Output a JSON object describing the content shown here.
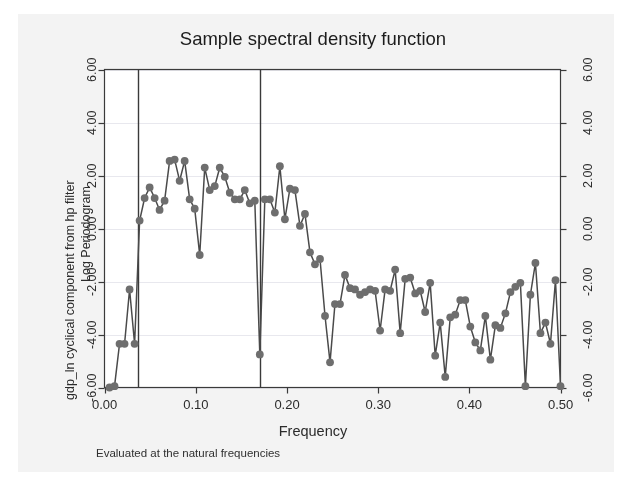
{
  "chart_data": {
    "type": "line",
    "title": "Sample spectral density function",
    "xlabel": "Frequency",
    "ylabel_outer": "gdp_ln cyclical component from hp filter",
    "ylabel_inner": "Log Periodogram",
    "footnote": "Evaluated at the natural frequencies",
    "xlim": [
      0.0,
      0.5
    ],
    "ylim": [
      -6.0,
      6.0
    ],
    "xticks": [
      0.0,
      0.1,
      0.2,
      0.3,
      0.4,
      0.5
    ],
    "xtick_labels": [
      "0.00",
      "0.10",
      "0.20",
      "0.30",
      "0.40",
      "0.50"
    ],
    "yticks": [
      -6.0,
      -4.0,
      -2.0,
      0.0,
      2.0,
      4.0,
      6.0
    ],
    "ytick_labels": [
      "-6.00",
      "-4.00",
      "-2.00",
      "0.00",
      "2.00",
      "4.00",
      "6.00"
    ],
    "ytick_labels_right": [
      "-6.00",
      "-4.00",
      "-2.00",
      "0.00",
      "2.00",
      "4.00",
      "6.00"
    ],
    "grid": true,
    "grid_axis": "y",
    "legend": "none",
    "marker": "circle",
    "marker_color": "#6e6e6e",
    "line_color": "#4a4a4a",
    "vlines": [
      0.0367,
      0.1702
    ],
    "vline_color": "#3a3a3a",
    "series": [
      {
        "name": "Log Periodogram",
        "x": [
          0.0055,
          0.011,
          0.0165,
          0.022,
          0.0275,
          0.033,
          0.0385,
          0.044,
          0.0495,
          0.055,
          0.0604,
          0.0659,
          0.0714,
          0.0769,
          0.0824,
          0.0879,
          0.0934,
          0.0989,
          0.1044,
          0.1099,
          0.1154,
          0.1209,
          0.1264,
          0.1319,
          0.1374,
          0.1429,
          0.1484,
          0.1538,
          0.1593,
          0.1648,
          0.1703,
          0.1758,
          0.1813,
          0.1868,
          0.1923,
          0.1978,
          0.2033,
          0.2088,
          0.2143,
          0.2198,
          0.2253,
          0.2308,
          0.2363,
          0.2418,
          0.2473,
          0.2527,
          0.2582,
          0.2637,
          0.2692,
          0.2747,
          0.2802,
          0.2857,
          0.2912,
          0.2967,
          0.3022,
          0.3077,
          0.3132,
          0.3187,
          0.3242,
          0.3297,
          0.3352,
          0.3407,
          0.3462,
          0.3516,
          0.3571,
          0.3626,
          0.3681,
          0.3736,
          0.3791,
          0.3846,
          0.3901,
          0.3956,
          0.4011,
          0.4066,
          0.4121,
          0.4176,
          0.4231,
          0.4286,
          0.4341,
          0.4396,
          0.4451,
          0.4505,
          0.456,
          0.4615,
          0.467,
          0.4725,
          0.478,
          0.4835,
          0.489,
          0.4945,
          0.5
        ],
        "values": [
          -6.0,
          -5.95,
          -4.35,
          -4.35,
          -2.3,
          -4.35,
          0.3,
          1.15,
          1.55,
          1.15,
          0.7,
          1.05,
          2.55,
          2.6,
          1.8,
          2.55,
          1.1,
          0.75,
          -1.0,
          2.3,
          1.45,
          1.6,
          2.3,
          1.95,
          1.35,
          1.1,
          1.1,
          1.45,
          0.95,
          1.05,
          -4.75,
          1.1,
          1.1,
          0.6,
          2.35,
          0.35,
          1.5,
          1.45,
          0.1,
          0.55,
          -0.9,
          -1.35,
          -1.15,
          -3.3,
          -5.05,
          -2.85,
          -2.85,
          -1.75,
          -2.25,
          -2.3,
          -2.5,
          -2.4,
          -2.3,
          -2.35,
          -3.85,
          -2.3,
          -2.35,
          -1.55,
          -3.95,
          -1.9,
          -1.85,
          -2.45,
          -2.35,
          -3.15,
          -2.05,
          -4.8,
          -3.55,
          -5.6,
          -3.35,
          -3.25,
          -2.7,
          -2.7,
          -3.7,
          -4.3,
          -4.6,
          -3.3,
          -4.95,
          -3.65,
          -3.75,
          -3.2,
          -2.4,
          -2.2,
          -2.05,
          -5.95,
          -2.5,
          -1.3,
          -3.95,
          -3.55,
          -4.35,
          -1.95,
          -5.95
        ]
      }
    ]
  },
  "axes": {
    "left_tick_labels": [
      "6.00",
      "4.00",
      "2.00",
      "0.00",
      "-2.00",
      "-4.00",
      "-6.00"
    ],
    "right_tick_labels": [
      "6.00",
      "4.00",
      "2.00",
      "0.00",
      "-2.00",
      "-4.00",
      "-6.00"
    ],
    "bottom_tick_labels": [
      "0.00",
      "0.10",
      "0.20",
      "0.30",
      "0.40",
      "0.50"
    ]
  },
  "colors": {
    "paper": "#f3f3f3",
    "plot_background": "#ffffff",
    "axis": "#3a3a3a",
    "grid": "#e8e8ee",
    "marker": "#6e6e6e",
    "line": "#4a4a4a",
    "text": "#2b2b2b"
  }
}
